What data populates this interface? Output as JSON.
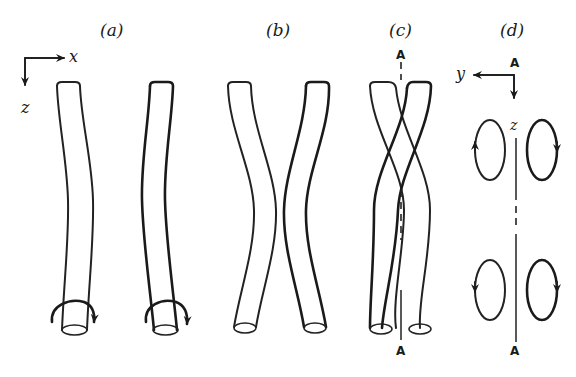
{
  "figure": {
    "panels": [
      {
        "id": "a",
        "label": "(a)",
        "description": "Two tubes with a slight bend, each with a rotation arrow at the bottom end"
      },
      {
        "id": "b",
        "label": "(b)",
        "description": "Two tubes bending toward each other at the middle"
      },
      {
        "id": "c",
        "label": "(c)",
        "description": "Two tubes twisted around a common axis A-A"
      },
      {
        "id": "d",
        "label": "(d)",
        "description": "Cross-section showing counter-rotating vortex loops on either side of axis A-A"
      }
    ],
    "axes_a": {
      "x_label": "x",
      "z_label": "z"
    },
    "axes_d": {
      "y_label": "y",
      "z_label": "z"
    },
    "axis_markers": {
      "top": "A",
      "bottom": "A"
    },
    "colors": {
      "ink": "#1a1a1a",
      "background": "#ffffff"
    }
  }
}
